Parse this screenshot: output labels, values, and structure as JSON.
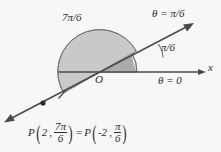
{
  "figure": {
    "kind": "polar-coordinate-diagram",
    "background_color": "#f7f7f7",
    "ink_color": "#2b2b2b",
    "labels": {
      "large_sector_angle": "7π/6",
      "ray_angle_equation": "θ = π/6",
      "small_sector_angle": "π/6",
      "polar_axis_equation": "θ = 0",
      "x_axis": "x",
      "origin": "O"
    },
    "equation": {
      "left_function": "P",
      "left_radius": "2",
      "left_angle_numerator": "7π",
      "left_angle_denominator": "6",
      "equals": "=",
      "right_function": "P",
      "right_radius": "-2",
      "right_angle_numerator": "π",
      "right_angle_denominator": "6",
      "full_text": "P(2, 7π/6) = P(-2, π/6)"
    },
    "sectors": {
      "large": {
        "label": "7π/6",
        "fill": "#c9c9c9",
        "start_deg": 30,
        "end_deg": 210,
        "radius": 42
      },
      "small": {
        "label": "π/6",
        "fill": "#e6e6e6",
        "start_deg": 0,
        "end_deg": 30,
        "radius": 37
      },
      "overlap": {
        "fill": "#a9a9a9",
        "start_deg": 0,
        "end_deg": 30,
        "radius": 37
      }
    },
    "geometry": {
      "origin_x": 100,
      "origin_y": 72,
      "x_axis_end_x": 205,
      "ray_angle_deg": 30,
      "ray_tip_upper_right_x": 193,
      "ray_tip_upper_right_y": 22,
      "ray_tip_lower_left_x": 5,
      "ray_tip_lower_left_y": 122,
      "point_marker_x": 43,
      "point_marker_y": 103
    }
  }
}
